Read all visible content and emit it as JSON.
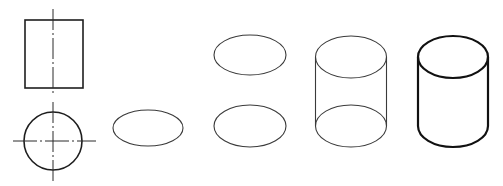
{
  "figure": {
    "background": "#ffffff",
    "stroke_color": "#1e1e1e"
  },
  "steps": [
    {
      "id": "step-1",
      "description": "Orthographic views: front view rectangle with vertical centerline; top view circle with cross centerlines",
      "front_view": {
        "x": 25,
        "y": 20,
        "width": 58,
        "height": 68
      },
      "top_view": {
        "cx": 53,
        "cy": 141,
        "r": 29
      },
      "centerlines": {
        "front_vertical": {
          "x": 53,
          "y1": 9,
          "y2": 96,
          "dash": "21 3 2 3"
        },
        "top_vertical": {
          "x": 53,
          "y1": 102,
          "y2": 182,
          "dash": "21 3 2 3"
        },
        "top_horizontal": {
          "y": 141,
          "x1": 13,
          "x2": 96,
          "dash": "24 3 2 3"
        }
      }
    },
    {
      "id": "step-2",
      "description": "Draw bottom ellipse",
      "ellipses": [
        {
          "cx": 148,
          "cy": 128,
          "rx": 35,
          "ry": 18
        }
      ]
    },
    {
      "id": "step-3",
      "description": "Draw top and bottom ellipses",
      "ellipses": [
        {
          "cx": 250,
          "cy": 55,
          "rx": 36,
          "ry": 20
        },
        {
          "cx": 250,
          "cy": 126,
          "rx": 36,
          "ry": 21
        }
      ]
    },
    {
      "id": "step-4",
      "description": "Connect ellipses with tangent lines (thin)",
      "cx": 351,
      "top_cy": 57,
      "bottom_cy": 126,
      "rx": 35.5,
      "ry": 21
    },
    {
      "id": "step-5",
      "description": "Finished cylinder with hidden arc removed (thick outline)",
      "cx": 453,
      "top_cy": 57,
      "bottom_cy": 126,
      "rx": 35,
      "ry": 21
    }
  ]
}
